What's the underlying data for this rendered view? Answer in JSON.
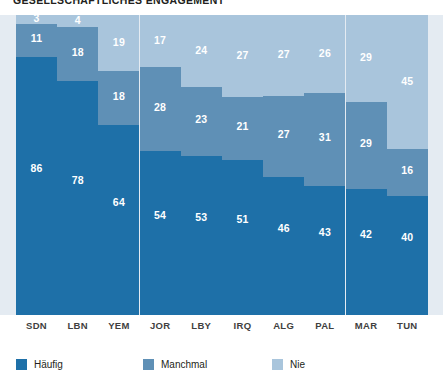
{
  "chart_data": {
    "type": "bar",
    "subtype": "stacked-bar-100-percent",
    "title": "GESELLSCHAFTLICHES ENGAGEMENT",
    "xlabel": "",
    "ylabel": "",
    "ylim": [
      0,
      100
    ],
    "grid": false,
    "legend_position": "bottom-left",
    "stack_order_bottom_to_top": [
      "Häufig",
      "Manchmal",
      "Nie"
    ],
    "categories": [
      "SDN",
      "LBN",
      "YEM",
      "JOR",
      "LBY",
      "IRQ",
      "ALG",
      "PAL",
      "MAR",
      "TUN"
    ],
    "series": [
      {
        "name": "Häufig",
        "color": "#1e70a8",
        "values": [
          86,
          78,
          64,
          54,
          53,
          51,
          46,
          43,
          42,
          40
        ]
      },
      {
        "name": "Manchmal",
        "color": "#5f90b6",
        "values": [
          11,
          18,
          18,
          28,
          23,
          21,
          27,
          31,
          29,
          16
        ]
      },
      {
        "name": "Nie",
        "color": "#a9c5dc",
        "values": [
          3,
          4,
          19,
          17,
          24,
          27,
          27,
          26,
          29,
          45
        ]
      }
    ],
    "plot_background_color": "#e4ebf2",
    "value_label_color": "#ffffff"
  },
  "legend": {
    "items": [
      {
        "label": "Häufig",
        "color": "#1e70a8"
      },
      {
        "label": "Manchmal",
        "color": "#5f90b6"
      },
      {
        "label": "Nie",
        "color": "#a9c5dc"
      }
    ]
  }
}
